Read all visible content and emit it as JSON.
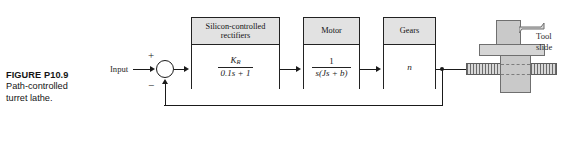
{
  "figure": {
    "caption_title": "FIGURE P10.9",
    "caption_line1": "Path-controlled",
    "caption_line2": "turret lathe."
  },
  "diagram": {
    "type": "control-system-block-diagram",
    "input_label": "Input",
    "summing_junction": {
      "positive_sign": "+",
      "negative_sign": "−"
    },
    "blocks": [
      {
        "id": "scr",
        "header_line1": "Silicon-controlled",
        "header_line2": "rectifiers",
        "numerator": "K",
        "numerator_sub": "R",
        "denominator": "0.1s + 1"
      },
      {
        "id": "motor",
        "header_line1": "Motor",
        "header_line2": "",
        "numerator": "1",
        "numerator_sub": "",
        "denominator": "s(Js + b)"
      },
      {
        "id": "gears",
        "header_line1": "Gears",
        "header_line2": "",
        "body_text": "n"
      }
    ],
    "mechanism": {
      "label_line1": "Tool",
      "label_line2": "slide"
    },
    "colors": {
      "line": "#1a1a1a",
      "block_header_fill": "#e2e2e2",
      "block_body_fill": "#ffffff",
      "mechanism_fill": "#c9c9c9",
      "page_background": "#ffffff"
    }
  }
}
